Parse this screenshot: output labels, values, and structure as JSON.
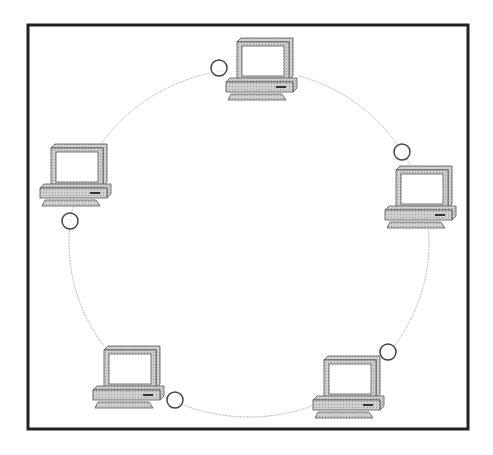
{
  "diagram": {
    "frame": {
      "x": 28,
      "y": 25,
      "width": 440,
      "height": 404,
      "stroke": "#222222",
      "stroke_width": 3
    },
    "ring": {
      "cx": 249,
      "cy": 243,
      "rx": 180,
      "ry": 174,
      "stroke": "#b8b8b8"
    },
    "colors": {
      "computer_fill": "#c8c8c8",
      "computer_stroke": "#555555",
      "screen_fill": "#ffffff",
      "connector_stroke": "#444444"
    },
    "nodes": [
      {
        "id": "computer-top",
        "x": 226,
        "y": 38
      },
      {
        "id": "computer-right",
        "x": 385,
        "y": 166
      },
      {
        "id": "computer-left",
        "x": 40,
        "y": 144
      },
      {
        "id": "computer-bottom-left",
        "x": 93,
        "y": 346
      },
      {
        "id": "computer-bottom-right",
        "x": 313,
        "y": 356
      }
    ],
    "connectors": [
      {
        "id": "connector-top",
        "cx": 219,
        "cy": 68
      },
      {
        "id": "connector-right",
        "cx": 402,
        "cy": 152
      },
      {
        "id": "connector-left",
        "cx": 70,
        "cy": 221
      },
      {
        "id": "connector-bottom-left",
        "cx": 175,
        "cy": 400
      },
      {
        "id": "connector-bottom-right",
        "cx": 388,
        "cy": 352
      }
    ],
    "connector_radius": 8
  }
}
